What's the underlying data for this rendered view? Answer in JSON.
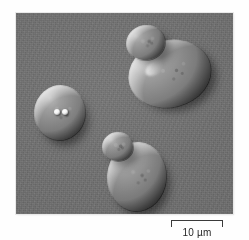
{
  "figure": {
    "kind": "light-microscopy-micrograph",
    "technique_appearance": "differential-interference-contrast",
    "specimen": "budding yeast cells",
    "panel": {
      "x": 16,
      "y": 13,
      "width": 217,
      "height": 201,
      "background_color": "#6f6f6f",
      "border_color": "#e9e9e9"
    },
    "scale_bar": {
      "label": "10 µm",
      "length_px": 52,
      "value": 10,
      "unit": "µm",
      "color": "#3a3a3a",
      "x": 171,
      "y": 220
    },
    "cells": [
      {
        "id": "upper-right-mother",
        "role": "mother",
        "cx": 170,
        "cy": 77,
        "rx": 41,
        "ry": 33,
        "rotate": -14
      },
      {
        "id": "upper-right-bud",
        "role": "bud",
        "cx": 146,
        "cy": 43,
        "rx": 19,
        "ry": 17,
        "rotate": -10
      },
      {
        "id": "left-mother",
        "role": "mother",
        "cx": 60,
        "cy": 113,
        "rx": 25,
        "ry": 27,
        "rotate": 6
      },
      {
        "id": "lower-middle-mother",
        "role": "mother",
        "cx": 137,
        "cy": 177,
        "rx": 29,
        "ry": 34,
        "rotate": 4
      },
      {
        "id": "lower-middle-bud",
        "role": "bud",
        "cx": 118,
        "cy": 147,
        "rx": 15,
        "ry": 14,
        "rotate": 0
      }
    ],
    "refractile_spots": [
      {
        "cx": 57,
        "cy": 112,
        "r": 3
      },
      {
        "cx": 65,
        "cy": 112,
        "r": 3
      }
    ],
    "colors": {
      "page_background": "#ffffff",
      "field_gray": "#6f6f6f",
      "highlight": "#ffffff",
      "shadow": "#000000",
      "label_text": "#262626"
    }
  }
}
